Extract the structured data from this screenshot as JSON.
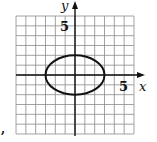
{
  "chart_data": {
    "type": "line",
    "title": "",
    "xlabel": "x",
    "ylabel": "y",
    "xlim": [
      -6,
      6
    ],
    "ylim": [
      -6,
      6
    ],
    "grid": true,
    "grid_step": 1,
    "tick_labels": {
      "x": "5",
      "y": "5"
    },
    "series": [
      {
        "name": "ellipse",
        "equation": "x^2/9 + y^2/4 = 1",
        "center": [
          0,
          0
        ],
        "semi_axis_x": 3,
        "semi_axis_y": 2
      }
    ],
    "annotation": ","
  },
  "labels": {
    "x_axis": "x",
    "y_axis": "y",
    "x_tick": "5",
    "y_tick": "5",
    "trailing_punct": ","
  },
  "colors": {
    "grid": "#8a8a8a",
    "axis": "#111111",
    "curve": "#111111"
  }
}
